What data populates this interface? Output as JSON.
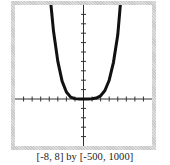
{
  "chart_data": {
    "type": "line",
    "title": "",
    "caption": "[-8, 8] by [-500, 1000]",
    "xlabel": "",
    "ylabel": "",
    "xlim": [
      -8,
      8
    ],
    "ylim": [
      -500,
      1000
    ],
    "xscale": 1,
    "yscale": 100,
    "grid": false,
    "axes_ticks_only": true,
    "series": [
      {
        "name": "curve-1",
        "description": "quartic-like U-shaped curve, flat near origin",
        "stroke_width": 3,
        "x": [
          -3.8,
          -3.5,
          -3,
          -2.5,
          -2,
          -1.5,
          -1,
          -0.5,
          0,
          0.5,
          1,
          1.5,
          2,
          2.5,
          3,
          3.5,
          4,
          4.3
        ],
        "y": [
          1000,
          720,
          400,
          190,
          75,
          20,
          4,
          0,
          0,
          0,
          2,
          10,
          35,
          90,
          200,
          390,
          680,
          1000
        ]
      }
    ],
    "colors": {
      "curve": "#111111",
      "axes": "#333333",
      "frame": "#cfcfcf",
      "background": "#ffffff"
    }
  }
}
